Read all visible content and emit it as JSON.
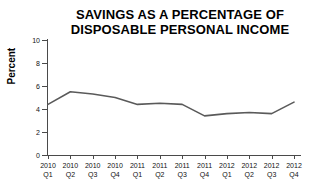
{
  "chart_data": {
    "type": "line",
    "title": "SAVINGS AS A PERCENTAGE OF DISPOSABLE PERSONAL INCOME",
    "title_lines": [
      "SAVINGS AS A PERCENTAGE OF",
      "DISPOSABLE PERSONAL INCOME"
    ],
    "xlabel": "",
    "ylabel": "Percent",
    "ylim": [
      0,
      10
    ],
    "yticks": [
      0,
      2,
      4,
      6,
      8,
      10
    ],
    "ytick_labels": [
      "0",
      "2",
      "4",
      "6",
      "8",
      "10"
    ],
    "grid": false,
    "legend": false,
    "line_color": "#5a5a5a",
    "axis_color": "#4a4a4a",
    "text_color": "#111111",
    "categories": [
      "2010 Q1",
      "2010 Q2",
      "2010 Q3",
      "2010 Q4",
      "2011 Q1",
      "2011 Q2",
      "2011 Q3",
      "2011 Q4",
      "2012 Q1",
      "2012 Q2",
      "2012 Q3",
      "2012 Q4"
    ],
    "category_lines": [
      {
        "year": "2010",
        "quarter": "Q1"
      },
      {
        "year": "2010",
        "quarter": "Q2"
      },
      {
        "year": "2010",
        "quarter": "Q3"
      },
      {
        "year": "2010",
        "quarter": "Q4"
      },
      {
        "year": "2011",
        "quarter": "Q1"
      },
      {
        "year": "2011",
        "quarter": "Q2"
      },
      {
        "year": "2011",
        "quarter": "Q3"
      },
      {
        "year": "2011",
        "quarter": "Q4"
      },
      {
        "year": "2012",
        "quarter": "Q1"
      },
      {
        "year": "2012",
        "quarter": "Q2"
      },
      {
        "year": "2012",
        "quarter": "Q3"
      },
      {
        "year": "2012",
        "quarter": "Q4"
      }
    ],
    "values": [
      4.4,
      5.5,
      5.3,
      5.0,
      4.4,
      4.5,
      4.4,
      3.4,
      3.6,
      3.7,
      3.6,
      4.6
    ],
    "series": [
      {
        "name": "Savings rate",
        "values": [
          4.4,
          5.5,
          5.3,
          5.0,
          4.4,
          4.5,
          4.4,
          3.4,
          3.6,
          3.7,
          3.6,
          4.6
        ]
      }
    ]
  }
}
